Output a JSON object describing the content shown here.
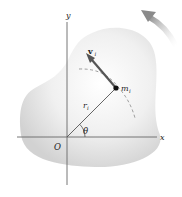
{
  "figure": {
    "type": "rigid-body-rotation-diagram",
    "labels": {
      "x_axis": "x",
      "y_axis": "y",
      "origin": "O",
      "velocity": "v",
      "velocity_sub": "i",
      "mass": "m",
      "mass_sub": "i",
      "radius": "r",
      "radius_sub": "i",
      "angle": "θ"
    },
    "icons": {
      "rotation_arrow": "counterclockwise-rotation-arrow",
      "velocity_arrow": "velocity-vector-arrow",
      "mass_point": "particle-dot"
    },
    "colors": {
      "body_fill_center": "#ffffff",
      "body_fill_edge": "#d4d4d4",
      "axis": "#555555",
      "velocity_vector": "#555555",
      "rotation_arrow": "#8a8a8a",
      "text": "#222222"
    }
  }
}
